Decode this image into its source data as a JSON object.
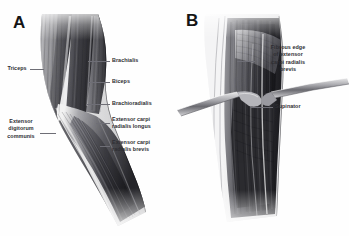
{
  "figure": {
    "type": "anatomical-illustration",
    "style": "grayscale medical illustration",
    "background_color": "#ffffff",
    "label_color": "#2e2e33",
    "leader_color": "#6e6e76"
  },
  "panels": [
    {
      "id": "A",
      "letter": "A",
      "caption": "Superficial muscles of the lateral arm and proximal forearm",
      "labels": [
        {
          "id": "triceps",
          "text": "Triceps",
          "side": "left",
          "align": "center"
        },
        {
          "id": "brachialis",
          "text": "Brachialis",
          "side": "right",
          "align": "left"
        },
        {
          "id": "biceps",
          "text": "Biceps",
          "side": "right",
          "align": "left"
        },
        {
          "id": "brachioradialis",
          "text": "Brachioradialis",
          "side": "right",
          "align": "left"
        },
        {
          "id": "ecrl",
          "text": "Extensor carpi\nradialis longus",
          "side": "right",
          "align": "left"
        },
        {
          "id": "ecrb",
          "text": "Extensor carpi\nradialis brevis",
          "side": "right",
          "align": "left"
        },
        {
          "id": "edc",
          "text": "Extensor\ndigitorum\ncommunis",
          "side": "left",
          "align": "center"
        }
      ]
    },
    {
      "id": "B",
      "letter": "B",
      "caption": "Deep dissection exposing the supinator and the fibrous edge of extensor carpi radialis brevis",
      "labels": [
        {
          "id": "fibrous-edge",
          "text": "Fibrous edge\nof extensor\ncarpi radialis\nbrevis",
          "side": "right",
          "align": "center"
        },
        {
          "id": "supinator",
          "text": "Supinator",
          "side": "right",
          "align": "left"
        }
      ]
    }
  ]
}
